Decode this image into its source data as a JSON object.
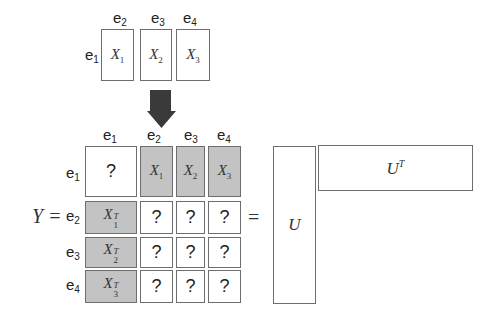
{
  "top": {
    "col_labels": [
      {
        "base": "e",
        "sub": "2"
      },
      {
        "base": "e",
        "sub": "3"
      },
      {
        "base": "e",
        "sub": "4"
      }
    ],
    "row_label": {
      "base": "e",
      "sub": "1"
    },
    "blocks": [
      {
        "base": "X",
        "sub": "1"
      },
      {
        "base": "X",
        "sub": "2"
      },
      {
        "base": "X",
        "sub": "3"
      }
    ]
  },
  "arrow": {
    "direction": "down",
    "color": "#3a3a3a"
  },
  "matrix": {
    "lhs": "Y =",
    "col_labels": [
      {
        "base": "e",
        "sub": "1"
      },
      {
        "base": "e",
        "sub": "2"
      },
      {
        "base": "e",
        "sub": "3"
      },
      {
        "base": "e",
        "sub": "4"
      }
    ],
    "row_labels": [
      {
        "base": "e",
        "sub": "1"
      },
      {
        "base": "e",
        "sub": "2"
      },
      {
        "base": "e",
        "sub": "3"
      },
      {
        "base": "e",
        "sub": "4"
      }
    ],
    "rows": [
      [
        {
          "t": "?",
          "fill": "white"
        },
        {
          "t": "X",
          "sub": "1",
          "fill": "gray"
        },
        {
          "t": "X",
          "sub": "2",
          "fill": "gray"
        },
        {
          "t": "X",
          "sub": "3",
          "fill": "gray"
        }
      ],
      [
        {
          "t": "X",
          "sub": "1",
          "sup": "T",
          "fill": "gray"
        },
        {
          "t": "?",
          "fill": "white"
        },
        {
          "t": "?",
          "fill": "white"
        },
        {
          "t": "?",
          "fill": "white"
        }
      ],
      [
        {
          "t": "X",
          "sub": "2",
          "sup": "T",
          "fill": "gray"
        },
        {
          "t": "?",
          "fill": "white"
        },
        {
          "t": "?",
          "fill": "white"
        },
        {
          "t": "?",
          "fill": "white"
        }
      ],
      [
        {
          "t": "X",
          "sub": "3",
          "sup": "T",
          "fill": "gray"
        },
        {
          "t": "?",
          "fill": "white"
        },
        {
          "t": "?",
          "fill": "white"
        },
        {
          "t": "?",
          "fill": "white"
        }
      ]
    ],
    "equals": "="
  },
  "factors": {
    "u": "U",
    "ut": {
      "base": "U",
      "sup": "T"
    }
  },
  "colors": {
    "gray_fill": "#c3c3c3",
    "border": "#6e6e6e"
  }
}
